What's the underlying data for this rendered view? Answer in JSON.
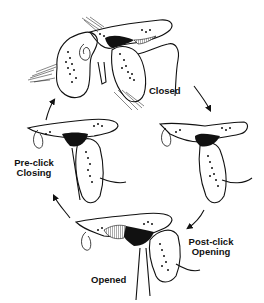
{
  "diagram": {
    "type": "cycle",
    "direction": "clockwise",
    "colors": {
      "ink": "#111111",
      "paper": "#ffffff"
    },
    "stages": [
      {
        "id": "closed",
        "label_lines": [
          "Closed"
        ],
        "icon": "anatomical-section-closed"
      },
      {
        "id": "post-click-opening",
        "label_lines": [
          "Post-click",
          "Opening"
        ],
        "icon": "anatomical-section-post-click-opening"
      },
      {
        "id": "opened",
        "label_lines": [
          "Opened"
        ],
        "icon": "anatomical-section-opened"
      },
      {
        "id": "pre-click-closing",
        "label_lines": [
          "Pre-click",
          "Closing"
        ],
        "icon": "anatomical-section-pre-click-closing"
      }
    ],
    "transitions": [
      {
        "from": "closed",
        "to": "post-click-opening"
      },
      {
        "from": "post-click-opening",
        "to": "opened"
      },
      {
        "from": "opened",
        "to": "pre-click-closing"
      },
      {
        "from": "pre-click-closing",
        "to": "closed"
      }
    ]
  }
}
